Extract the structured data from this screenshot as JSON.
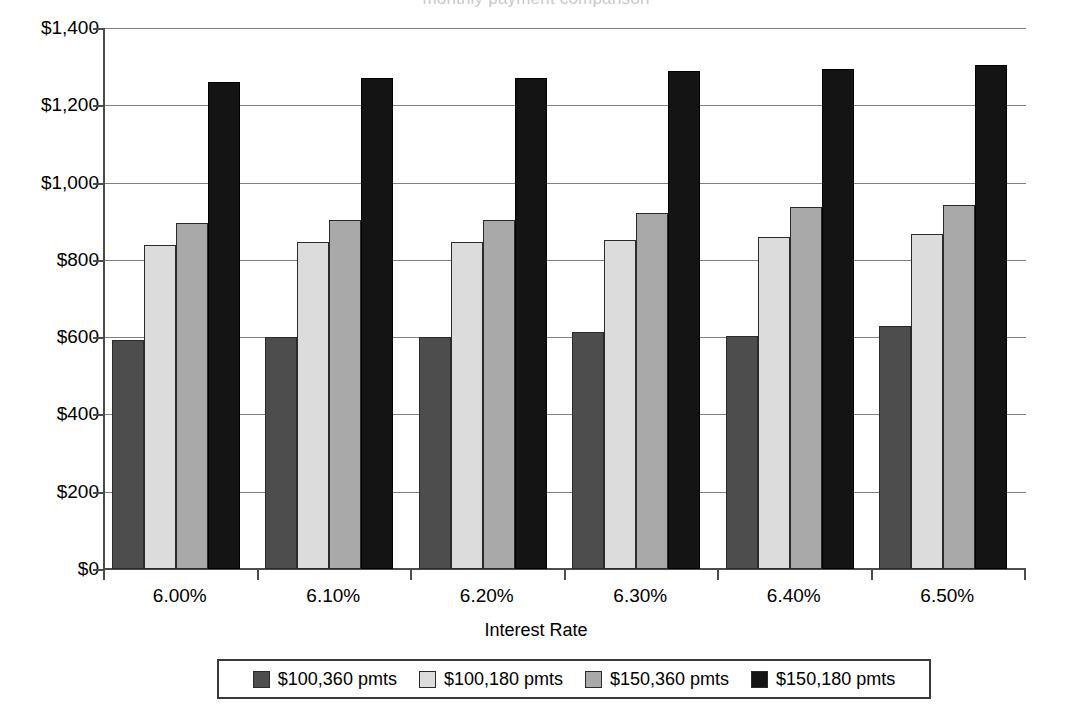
{
  "chart_data": {
    "type": "bar",
    "title": "",
    "xlabel": "Interest Rate",
    "ylabel": "",
    "categories": [
      "6.00%",
      "6.10%",
      "6.20%",
      "6.30%",
      "6.40%",
      "6.50%"
    ],
    "series": [
      {
        "name": "$100,360 pmts",
        "color": "#4d4d4d",
        "values": [
          593,
          600,
          601,
          614,
          603,
          629
        ]
      },
      {
        "name": "$100,180 pmts",
        "color": "#dcdcdc",
        "values": [
          838,
          847,
          847,
          852,
          858,
          866
        ]
      },
      {
        "name": "$150,360 pmts",
        "color": "#a9a9a9",
        "values": [
          895,
          903,
          903,
          922,
          936,
          942
        ]
      },
      {
        "name": "$150,180 pmts",
        "color": "#141414",
        "values": [
          1261,
          1270,
          1270,
          1289,
          1295,
          1303
        ]
      }
    ],
    "ylim": [
      0,
      1400
    ],
    "yticks": [
      0,
      200,
      400,
      600,
      800,
      1000,
      1200,
      1400
    ],
    "ytick_labels": [
      "$0",
      "$200",
      "$400",
      "$600",
      "$800",
      "$1,000",
      "$1,200",
      "$1,400"
    ],
    "grid": true,
    "legend_position": "bottom",
    "partial_top_title": "monthly payment comparison"
  }
}
